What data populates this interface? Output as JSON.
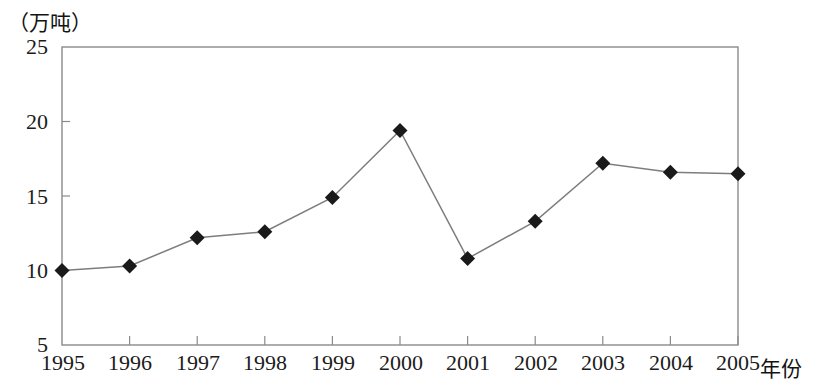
{
  "chart_data": {
    "type": "line",
    "title": "",
    "subtitle": "",
    "unit_label": "（万吨）",
    "xlabel": "年份",
    "ylabel": "",
    "categories": [
      "1995",
      "1996",
      "1997",
      "1998",
      "1999",
      "2000",
      "2001",
      "2002",
      "2003",
      "2004",
      "2005"
    ],
    "values": [
      10.0,
      10.3,
      12.2,
      12.6,
      14.9,
      19.4,
      10.8,
      13.3,
      17.2,
      16.6,
      16.5
    ],
    "series": [
      {
        "name": "产量",
        "values": [
          10.0,
          10.3,
          12.2,
          12.6,
          14.9,
          19.4,
          10.8,
          13.3,
          17.2,
          16.6,
          16.5
        ]
      }
    ],
    "ylim": [
      5,
      25
    ],
    "yticks": [
      5,
      10,
      15,
      20,
      25
    ],
    "ytick_labels": [
      "5",
      "10",
      "15",
      "20",
      "25"
    ],
    "xtick_labels": [
      "1995",
      "1996",
      "1997",
      "1998",
      "1999",
      "2000",
      "2001",
      "2002",
      "2003",
      "2004",
      "2005"
    ],
    "grid": false,
    "legend": "none",
    "marker": "diamond",
    "marker_color": "#1a1a1a",
    "line_color": "#7d7d7d",
    "axis_color": "#8a8a8a",
    "plot_background": "#ffffff"
  },
  "axis": {
    "y_unit_caption": "（万吨）",
    "x_caption": "年份"
  }
}
